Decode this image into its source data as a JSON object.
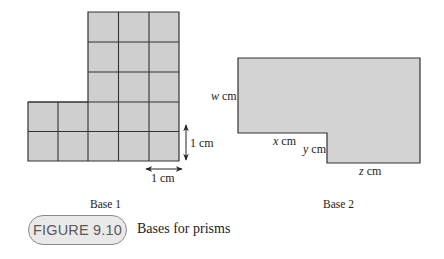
{
  "figure": {
    "label": "FIGURE 9.10",
    "caption": "Bases for prisms"
  },
  "base1": {
    "title": "Base 1",
    "grid": {
      "top_block": {
        "columns": 3,
        "rows": 3
      },
      "bottom_block": {
        "columns": 5,
        "rows": 2
      },
      "cell_color": "#cfcfcf",
      "line_color": "#333333"
    },
    "vertical_scale_label": "1 cm",
    "horizontal_scale_label": "1 cm"
  },
  "base2": {
    "title": "Base 2",
    "fill_color": "#d3d3d3",
    "labels": {
      "w": "w cm",
      "x": "x cm",
      "y": "y cm",
      "z": "z cm"
    }
  }
}
